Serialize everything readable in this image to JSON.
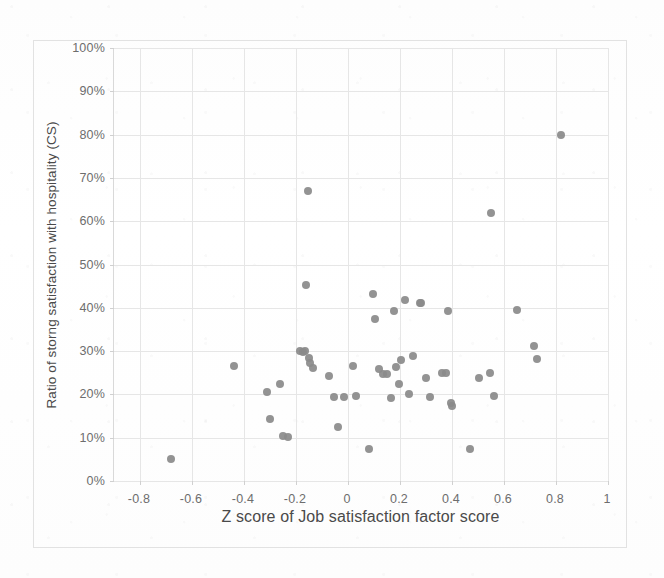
{
  "chart_data": {
    "type": "scatter",
    "title": "",
    "xlabel": "Z score of Job satisfaction factor score",
    "ylabel": "Ratio of storng satisfaction with hospitality (CS)",
    "xlim": [
      -0.9,
      1.0
    ],
    "ylim": [
      0,
      1.0
    ],
    "grid": true,
    "legend": null,
    "marker_color": "#8a8a8a",
    "xticks": [
      "-0.8",
      "-0.6",
      "-0.4",
      "-0.2",
      "0",
      "0.2",
      "0.4",
      "0.6",
      "0.8",
      "1"
    ],
    "xtick_values": [
      -0.8,
      -0.6,
      -0.4,
      -0.2,
      0,
      0.2,
      0.4,
      0.6,
      0.8,
      1
    ],
    "yticks": [
      "0%",
      "10%",
      "20%",
      "30%",
      "40%",
      "50%",
      "60%",
      "70%",
      "80%",
      "90%",
      "100%"
    ],
    "ytick_values": [
      0,
      0.1,
      0.2,
      0.3,
      0.4,
      0.5,
      0.6,
      0.7,
      0.8,
      0.9,
      1.0
    ],
    "points": [
      {
        "x": -0.68,
        "y": 0.05
      },
      {
        "x": -0.44,
        "y": 0.265
      },
      {
        "x": -0.31,
        "y": 0.205
      },
      {
        "x": -0.3,
        "y": 0.143
      },
      {
        "x": -0.26,
        "y": 0.225
      },
      {
        "x": -0.25,
        "y": 0.104
      },
      {
        "x": -0.23,
        "y": 0.102
      },
      {
        "x": -0.185,
        "y": 0.3
      },
      {
        "x": -0.175,
        "y": 0.299
      },
      {
        "x": -0.165,
        "y": 0.3
      },
      {
        "x": -0.155,
        "y": 0.67
      },
      {
        "x": -0.15,
        "y": 0.284
      },
      {
        "x": -0.145,
        "y": 0.272
      },
      {
        "x": -0.16,
        "y": 0.452
      },
      {
        "x": -0.135,
        "y": 0.261
      },
      {
        "x": -0.075,
        "y": 0.242
      },
      {
        "x": -0.055,
        "y": 0.195
      },
      {
        "x": -0.04,
        "y": 0.124
      },
      {
        "x": -0.015,
        "y": 0.194
      },
      {
        "x": 0.02,
        "y": 0.265
      },
      {
        "x": 0.03,
        "y": 0.196
      },
      {
        "x": 0.08,
        "y": 0.074
      },
      {
        "x": 0.095,
        "y": 0.433
      },
      {
        "x": 0.105,
        "y": 0.374
      },
      {
        "x": 0.12,
        "y": 0.258
      },
      {
        "x": 0.135,
        "y": 0.247
      },
      {
        "x": 0.15,
        "y": 0.248
      },
      {
        "x": 0.165,
        "y": 0.191
      },
      {
        "x": 0.175,
        "y": 0.392
      },
      {
        "x": 0.185,
        "y": 0.263
      },
      {
        "x": 0.195,
        "y": 0.224
      },
      {
        "x": 0.205,
        "y": 0.279
      },
      {
        "x": 0.22,
        "y": 0.419
      },
      {
        "x": 0.235,
        "y": 0.201
      },
      {
        "x": 0.25,
        "y": 0.288
      },
      {
        "x": 0.275,
        "y": 0.411
      },
      {
        "x": 0.28,
        "y": 0.412
      },
      {
        "x": 0.3,
        "y": 0.237
      },
      {
        "x": 0.315,
        "y": 0.194
      },
      {
        "x": 0.36,
        "y": 0.25
      },
      {
        "x": 0.375,
        "y": 0.249
      },
      {
        "x": 0.385,
        "y": 0.392
      },
      {
        "x": 0.395,
        "y": 0.181
      },
      {
        "x": 0.4,
        "y": 0.174
      },
      {
        "x": 0.47,
        "y": 0.075
      },
      {
        "x": 0.505,
        "y": 0.238
      },
      {
        "x": 0.545,
        "y": 0.25
      },
      {
        "x": 0.55,
        "y": 0.62
      },
      {
        "x": 0.56,
        "y": 0.197
      },
      {
        "x": 0.65,
        "y": 0.395
      },
      {
        "x": 0.715,
        "y": 0.312
      },
      {
        "x": 0.725,
        "y": 0.281
      },
      {
        "x": 0.82,
        "y": 0.8
      }
    ]
  }
}
